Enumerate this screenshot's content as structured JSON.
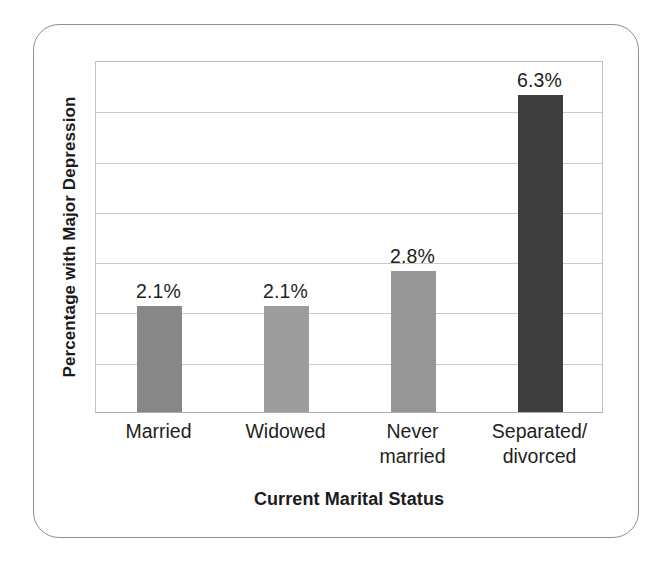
{
  "chart_data": {
    "type": "bar",
    "title": "",
    "xlabel": "Current Marital Status",
    "ylabel": "Percentage with Major Depression",
    "categories": [
      "Married",
      "Widowed",
      "Never married",
      "Separated/ divorced"
    ],
    "category_lines": [
      [
        "Married"
      ],
      [
        "Widowed"
      ],
      [
        "Never",
        "married"
      ],
      [
        "Separated/",
        "divorced"
      ]
    ],
    "values": [
      2.1,
      2.1,
      2.8,
      6.3
    ],
    "value_labels": [
      "2.1%",
      "2.1%",
      "2.8%",
      "6.3%"
    ],
    "bar_colors": [
      "#878787",
      "#9d9d9d",
      "#969696",
      "#3e3e3e"
    ],
    "ylim": [
      0,
      7
    ],
    "y_tick_interval": 1,
    "y_tick_labels_shown": false,
    "gridlines": [
      1,
      2,
      3,
      4,
      5,
      6
    ],
    "grid": true,
    "grid_color": "#c9c9c9",
    "legend": false,
    "units": "percent"
  },
  "frame": {
    "border_color": "#8d8f92"
  }
}
